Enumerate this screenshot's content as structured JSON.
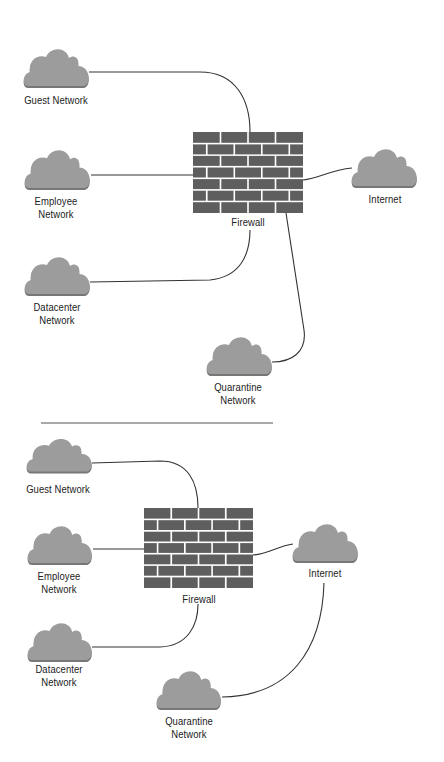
{
  "colors": {
    "cloud_fill": "#9c9c9c",
    "cloud_shadow": "#777777",
    "brick": "#5e5e5e",
    "mortar": "#ffffff",
    "line": "#333333",
    "divider": "#555555",
    "text": "#222222"
  },
  "divider": {
    "x1": 41,
    "x2": 273,
    "y": 423
  },
  "diagrams": [
    {
      "name": "top",
      "firewall": {
        "label": "Firewall",
        "x": 193,
        "y": 132,
        "w": 110,
        "h": 81,
        "rows": 7,
        "label_x": 248,
        "label_y": 216
      },
      "clouds": [
        {
          "id": "guest",
          "lines": [
            "Guest Network"
          ],
          "x": 22,
          "y": 46,
          "w": 68,
          "h": 44,
          "label_x": 56,
          "label_y": 94
        },
        {
          "id": "employee",
          "lines": [
            "Employee",
            "Network"
          ],
          "x": 23,
          "y": 147,
          "w": 68,
          "h": 45,
          "label_x": 56,
          "label_y": 195
        },
        {
          "id": "datacenter",
          "lines": [
            "Datacenter",
            "Network"
          ],
          "x": 23,
          "y": 254,
          "w": 68,
          "h": 44,
          "label_x": 57,
          "label_y": 301
        },
        {
          "id": "internet",
          "lines": [
            "Internet"
          ],
          "x": 350,
          "y": 146,
          "w": 68,
          "h": 44,
          "label_x": 385,
          "label_y": 193
        },
        {
          "id": "quarantine",
          "lines": [
            "Quarantine",
            "Network"
          ],
          "x": 205,
          "y": 334,
          "w": 68,
          "h": 44,
          "label_x": 238,
          "label_y": 381
        }
      ],
      "connections": [
        {
          "from": "guest",
          "to": "firewall",
          "path": "M89 72 L200 72 C236 72 250 100 250 132"
        },
        {
          "from": "employee",
          "to": "firewall",
          "path": "M91 175 L193 175"
        },
        {
          "from": "datacenter",
          "to": "firewall",
          "path": "M90 282 L210 280 C240 277 250 255 250 230"
        },
        {
          "from": "firewall",
          "to": "internet",
          "path": "M303 180 C320 178 330 170 352 168"
        },
        {
          "from": "firewall",
          "to": "quarantine",
          "path": "M286 213 L304 330 C307 352 292 362 272 362"
        }
      ]
    },
    {
      "name": "bottom",
      "firewall": {
        "label": "Firewall",
        "x": 144,
        "y": 508,
        "w": 109,
        "h": 80,
        "rows": 7,
        "label_x": 199,
        "label_y": 593
      },
      "clouds": [
        {
          "id": "guest",
          "lines": [
            "Guest Network"
          ],
          "x": 25,
          "y": 436,
          "w": 68,
          "h": 39,
          "label_x": 58,
          "label_y": 483
        },
        {
          "id": "employee",
          "lines": [
            "Employee",
            "Network"
          ],
          "x": 26,
          "y": 523,
          "w": 67,
          "h": 44,
          "label_x": 59,
          "label_y": 570
        },
        {
          "id": "datacenter",
          "lines": [
            "Datacenter",
            "Network"
          ],
          "x": 26,
          "y": 620,
          "w": 67,
          "h": 44,
          "label_x": 59,
          "label_y": 663
        },
        {
          "id": "internet",
          "lines": [
            "Internet"
          ],
          "x": 291,
          "y": 521,
          "w": 68,
          "h": 44,
          "label_x": 325,
          "label_y": 567
        },
        {
          "id": "quarantine",
          "lines": [
            "Quarantine",
            "Network"
          ],
          "x": 155,
          "y": 668,
          "w": 67,
          "h": 44,
          "label_x": 189,
          "label_y": 715
        }
      ],
      "connections": [
        {
          "from": "guest",
          "to": "firewall",
          "path": "M92 463 L160 461 C188 461 198 482 198 508"
        },
        {
          "from": "employee",
          "to": "firewall",
          "path": "M93 549 L144 549"
        },
        {
          "from": "datacenter",
          "to": "firewall",
          "path": "M92 647 L160 647 C188 646 198 625 198 604"
        },
        {
          "from": "firewall",
          "to": "internet",
          "path": "M253 555 C268 554 278 546 293 544"
        },
        {
          "from": "internet",
          "to": "quarantine",
          "path": "M324 583 C322 650 290 696 222 697"
        }
      ]
    }
  ]
}
